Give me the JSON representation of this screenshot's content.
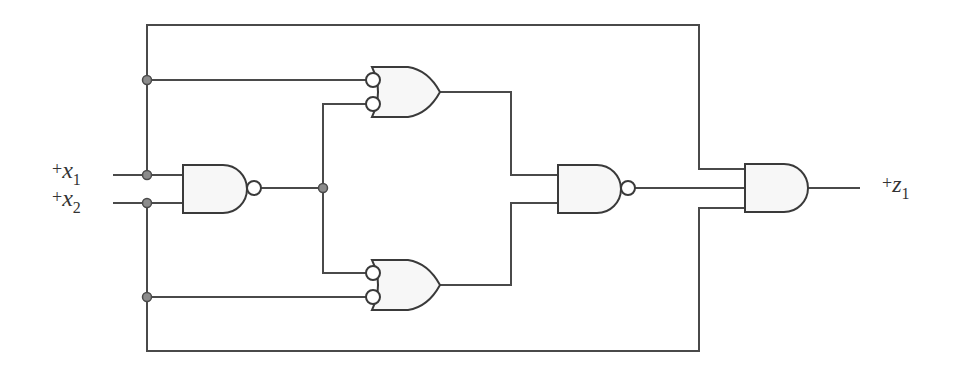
{
  "diagram": {
    "type": "logic-circuit",
    "inputs": [
      {
        "id": "x1",
        "prefix": "+",
        "var": "x",
        "subscript": "1"
      },
      {
        "id": "x2",
        "prefix": "+",
        "var": "x",
        "subscript": "2"
      }
    ],
    "outputs": [
      {
        "id": "z1",
        "prefix": "+",
        "var": "z",
        "subscript": "1"
      }
    ],
    "gates": [
      {
        "id": "g1",
        "type": "NAND",
        "inputs": [
          "x1",
          "x2"
        ]
      },
      {
        "id": "g2",
        "type": "OR",
        "inverted_inputs": true,
        "inputs": [
          "x1",
          "g1"
        ]
      },
      {
        "id": "g3",
        "type": "OR",
        "inverted_inputs": true,
        "inputs": [
          "g1",
          "x2"
        ]
      },
      {
        "id": "g4",
        "type": "NAND",
        "inputs": [
          "g2",
          "g3"
        ]
      },
      {
        "id": "g5",
        "type": "AND",
        "inputs": [
          "x1",
          "g4",
          "x2"
        ]
      }
    ],
    "colors": {
      "wire": "#4a4a4a",
      "gate_fill": "#f7f7f7",
      "junction_dot": "#8c8c8c"
    }
  }
}
